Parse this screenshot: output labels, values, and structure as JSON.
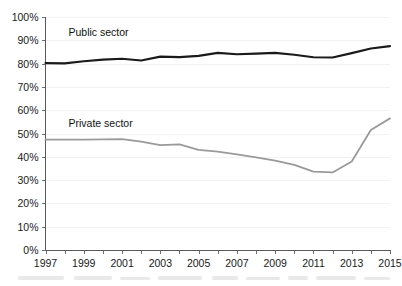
{
  "chart_data": {
    "type": "line",
    "title": "",
    "subtitle": "",
    "xlabel": "",
    "ylabel": "",
    "xlim": [
      1997,
      2015
    ],
    "ylim": [
      0,
      100
    ],
    "grid": true,
    "legend_position": "inline-labels",
    "y_tick_labels": [
      "0%",
      "10%",
      "20%",
      "30%",
      "40%",
      "50%",
      "60%",
      "70%",
      "80%",
      "90%",
      "100%"
    ],
    "y_tick_values": [
      0,
      10,
      20,
      30,
      40,
      50,
      60,
      70,
      80,
      90,
      100
    ],
    "x_tick_labels": [
      "1997",
      "1999",
      "2001",
      "2003",
      "2005",
      "2007",
      "2009",
      "2011",
      "2013",
      "2015"
    ],
    "x_tick_values": [
      1997,
      1999,
      2001,
      2003,
      2005,
      2007,
      2009,
      2011,
      2013,
      2015
    ],
    "x_minor_ticks": [
      1998,
      2000,
      2002,
      2004,
      2006,
      2008,
      2010,
      2012,
      2014
    ],
    "x": [
      1997,
      1998,
      1999,
      2000,
      2001,
      2002,
      2003,
      2004,
      2005,
      2006,
      2007,
      2008,
      2009,
      2010,
      2011,
      2012,
      2013,
      2014,
      2015
    ],
    "series": [
      {
        "name": "Public sector",
        "color": "#1a1a1a",
        "stroke_width": 2.1,
        "label_x": 1998.2,
        "label_y": 92,
        "values": [
          80.2,
          80.1,
          81.0,
          81.7,
          82.1,
          81.3,
          83.0,
          82.8,
          83.3,
          84.6,
          84.0,
          84.3,
          84.6,
          83.8,
          82.7,
          82.6,
          84.5,
          86.5,
          87.5
        ]
      },
      {
        "name": "Private sector",
        "color": "#9a9a9a",
        "stroke_width": 1.8,
        "label_x": 1998.2,
        "label_y": 53,
        "values": [
          47.4,
          47.4,
          47.4,
          47.5,
          47.6,
          46.5,
          45.0,
          45.3,
          43.0,
          42.2,
          41.0,
          39.8,
          38.4,
          36.5,
          33.6,
          33.3,
          38.0,
          51.5,
          56.5
        ]
      }
    ]
  }
}
